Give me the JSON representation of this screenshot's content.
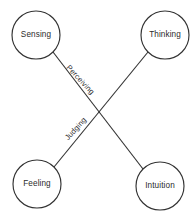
{
  "diagram": {
    "background_color": "#ffffff",
    "stroke_color": "#333333",
    "text_color": "#2b2b2b",
    "nodes": [
      {
        "id": "sensing",
        "label": "Sensing",
        "cx": 36,
        "cy": 35,
        "r": 24
      },
      {
        "id": "thinking",
        "label": "Thinking",
        "cx": 165,
        "cy": 35,
        "r": 24
      },
      {
        "id": "feeling",
        "label": "Feeling",
        "cx": 37,
        "cy": 184,
        "r": 24
      },
      {
        "id": "intuition",
        "label": "Intuition",
        "cx": 160,
        "cy": 186,
        "r": 24
      }
    ],
    "edges": [
      {
        "id": "perceiving",
        "label": "Perceiving",
        "from": "sensing",
        "to": "intuition",
        "label_x": 80,
        "label_y": 80,
        "label_rotation": 47
      },
      {
        "id": "judging",
        "label": "Judging",
        "from": "feeling",
        "to": "thinking",
        "label_x": 76,
        "label_y": 129,
        "label_rotation": -48
      }
    ]
  }
}
